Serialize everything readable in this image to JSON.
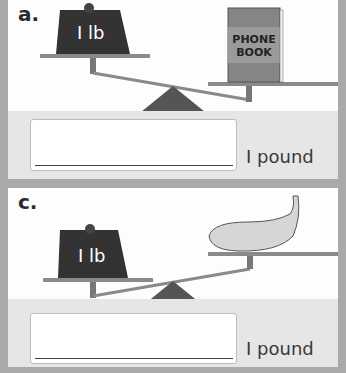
{
  "problems": [
    {
      "label": "a.",
      "weight_label": "I lb",
      "object": "PHONE BOOK",
      "object_line1": "PHONE",
      "object_line2": "BOOK",
      "unit": "I pound"
    },
    {
      "label": "c.",
      "weight_label": "I lb",
      "object": "banana",
      "unit": "I pound"
    }
  ]
}
